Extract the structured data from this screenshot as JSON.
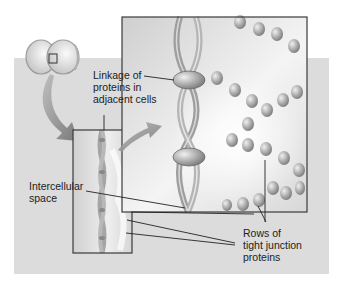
{
  "diagram": {
    "type": "biology-illustration",
    "subject": "tight junction",
    "colors": {
      "panel_background": "#dcdcdc",
      "box_border": "#3a3a3a",
      "membrane_fill": "#b8b8b8",
      "protein_fill": "#a8a8a8",
      "leader_line": "#222222"
    },
    "labels": {
      "linkage": "Linkage of\nproteins in\nadjacent cells",
      "intercellular": "Intercellular\nspace",
      "rows": "Rows of\ntight junction\nproteins"
    }
  }
}
